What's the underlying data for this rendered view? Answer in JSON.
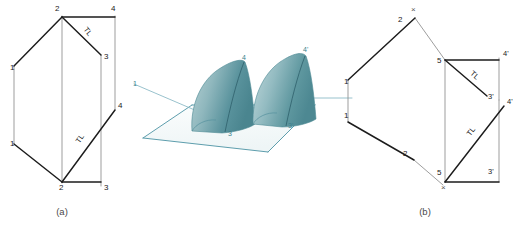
{
  "figure": {
    "background_color": "#ffffff",
    "heavy_line_color": "#1c1c1c",
    "light_line_color": "#8d8d8d",
    "pictorial_accent_color": "#4c93a4",
    "shell_fill_light": "#cfe0e2",
    "shell_fill_dark": "#4f8d96",
    "caption_color": "#4a4a4a"
  },
  "captions": {
    "left": "(a)",
    "right": "(b)"
  },
  "panel_a": {
    "name": "orthographic-view-a",
    "tl_labels": [
      {
        "text": "TL",
        "x": 86,
        "y": 33,
        "rotate": 52
      },
      {
        "text": "TL",
        "x": 82,
        "y": 140,
        "rotate": -56
      }
    ],
    "vertex_labels": [
      {
        "text": "2",
        "x": 55,
        "y": 11
      },
      {
        "text": "4",
        "x": 111,
        "y": 11
      },
      {
        "text": "3",
        "x": 104,
        "y": 59
      },
      {
        "text": "1",
        "x": 10,
        "y": 70
      },
      {
        "text": "4",
        "x": 118,
        "y": 108
      },
      {
        "text": "1",
        "x": 10,
        "y": 146
      },
      {
        "text": "2",
        "x": 59,
        "y": 190
      },
      {
        "text": "3",
        "x": 104,
        "y": 190
      }
    ]
  },
  "panel_pictorial": {
    "name": "pictorial-3d-view",
    "labels": [
      {
        "text": "1",
        "x": 133,
        "y": 86
      },
      {
        "text": "4",
        "x": 242,
        "y": 60
      },
      {
        "text": "3",
        "x": 228,
        "y": 136
      },
      {
        "text": "4'",
        "x": 303,
        "y": 52
      },
      {
        "text": "3'",
        "x": 288,
        "y": 128
      }
    ]
  },
  "panel_b": {
    "name": "orthographic-view-b",
    "tl_labels": [
      {
        "text": "TL",
        "x": 473,
        "y": 77
      },
      {
        "text": "TL",
        "x": 473,
        "y": 133
      }
    ],
    "x_marks": [
      {
        "text": "×",
        "x": 411,
        "y": 12
      },
      {
        "text": "×",
        "x": 441,
        "y": 190
      }
    ],
    "vertex_labels": [
      {
        "text": "2",
        "x": 398,
        "y": 22
      },
      {
        "text": "5",
        "x": 439,
        "y": 63
      },
      {
        "text": "4'",
        "x": 504,
        "y": 56
      },
      {
        "text": "1",
        "x": 344,
        "y": 84
      },
      {
        "text": "3'",
        "x": 489,
        "y": 99
      },
      {
        "text": "4'",
        "x": 508,
        "y": 104
      },
      {
        "text": "1",
        "x": 344,
        "y": 118
      },
      {
        "text": "2",
        "x": 403,
        "y": 156
      },
      {
        "text": "5",
        "x": 439,
        "y": 175
      },
      {
        "text": "3'",
        "x": 489,
        "y": 174
      }
    ]
  }
}
